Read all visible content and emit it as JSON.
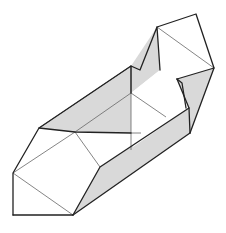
{
  "figure": {
    "type": "origami-box-diagram",
    "colors": {
      "background": "#ffffff",
      "shade": "#d9d9d9",
      "edge": "#222222",
      "crease": "#666666"
    }
  }
}
